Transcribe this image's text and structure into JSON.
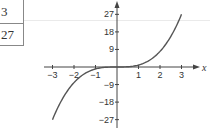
{
  "table_fragment": {
    "rows": [
      {
        "value": "3"
      },
      {
        "value": "27"
      }
    ]
  },
  "chart_data": {
    "type": "line",
    "title": "",
    "function": "y = x^3",
    "xlabel": "x",
    "ylabel": "",
    "xlim": [
      -3,
      3
    ],
    "ylim": [
      -27,
      27
    ],
    "x_ticks": [
      -3,
      -2,
      -1,
      1,
      2,
      3
    ],
    "x_tick_labels": [
      "−3",
      "−2",
      "−1",
      "1",
      "2",
      "3"
    ],
    "y_ticks": [
      27,
      18,
      9,
      -9,
      -18,
      -27
    ],
    "y_tick_labels": [
      "27",
      "18",
      "9",
      "−9",
      "−18",
      "−27"
    ],
    "grid": false,
    "legend": null,
    "series": [
      {
        "name": "y = x^3",
        "x": [
          -3,
          -2.5,
          -2,
          -1.5,
          -1,
          -0.5,
          0,
          0.5,
          1,
          1.5,
          2,
          2.5,
          3
        ],
        "y": [
          -27,
          -15.625,
          -8,
          -3.375,
          -1,
          -0.125,
          0,
          0.125,
          1,
          3.375,
          8,
          15.625,
          27
        ]
      }
    ],
    "colors": {
      "curve": "#555555",
      "axes": "#444444"
    }
  }
}
